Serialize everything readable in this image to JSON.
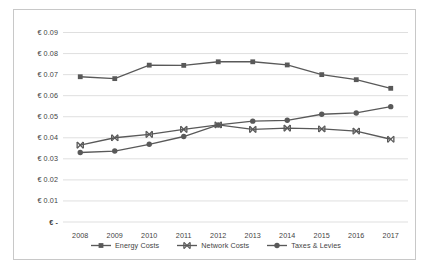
{
  "chart_data": {
    "type": "line",
    "title": "",
    "xlabel": "",
    "ylabel": "",
    "categories": [
      2008,
      2009,
      2010,
      2011,
      2012,
      2013,
      2014,
      2015,
      2016,
      2017
    ],
    "x_tick_labels": [
      "2008",
      "2009",
      "2010",
      "2011",
      "2012",
      "2013",
      "2014",
      "2015",
      "2016",
      "2017"
    ],
    "y_tick_labels": [
      "€ 0.09",
      "€ 0.08",
      "€ 0.07",
      "€ 0.06",
      "€ 0.05",
      "€ 0.04",
      "€ 0.03",
      "€ 0.02",
      "€ 0.01",
      "€  -"
    ],
    "y_tick_values": [
      0.09,
      0.08,
      0.07,
      0.06,
      0.05,
      0.04,
      0.03,
      0.02,
      0.01,
      0
    ],
    "ylim": [
      0,
      0.095
    ],
    "grid": "horizontal",
    "legend_position": "bottom",
    "series": [
      {
        "name": "Energy Costs",
        "marker": "square",
        "color": "#595959",
        "values": [
          0.069,
          0.0681,
          0.0745,
          0.0744,
          0.0761,
          0.0761,
          0.0746,
          0.07,
          0.0676,
          0.0635
        ]
      },
      {
        "name": "Network Costs",
        "marker": "cross",
        "color": "#595959",
        "values": [
          0.0365,
          0.04,
          0.0416,
          0.044,
          0.0461,
          0.044,
          0.0446,
          0.0442,
          0.0432,
          0.0393
        ]
      },
      {
        "name": "Taxes & Levies",
        "marker": "circle",
        "color": "#595959",
        "values": [
          0.033,
          0.0337,
          0.0369,
          0.0406,
          0.0461,
          0.0479,
          0.0483,
          0.0512,
          0.0518,
          0.0548
        ]
      }
    ]
  },
  "colors": {
    "line": "#595959",
    "grid": "#dfdfdf",
    "border": "#c8c8c8",
    "text": "#3f3f3f"
  }
}
